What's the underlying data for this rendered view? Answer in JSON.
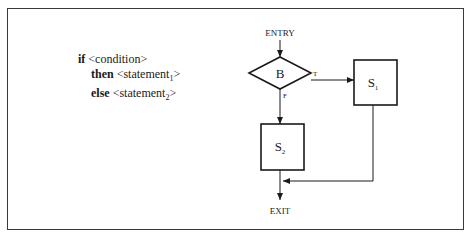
{
  "code": {
    "if_keyword": "if",
    "condition": "<condition>",
    "then_keyword": "then",
    "statement1_prefix": "<statement",
    "statement1_sub": "1",
    "statement1_suffix": ">",
    "else_keyword": "else",
    "statement2_prefix": "<statement",
    "statement2_sub": "2",
    "statement2_suffix": ">"
  },
  "flowchart": {
    "entry_label": "ENTRY",
    "exit_label": "EXIT",
    "decision_label": "B",
    "true_label": "T",
    "false_label": "F",
    "s1_label": "S",
    "s1_sub": "1",
    "s2_label": "S",
    "s2_sub": "2"
  }
}
